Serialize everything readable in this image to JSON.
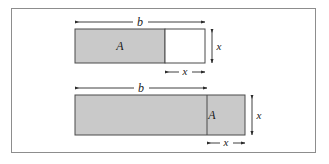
{
  "figure": {
    "background_color": "#ffffff",
    "frame": {
      "name": "outer-frame",
      "x": 11,
      "y": 8,
      "width": 305,
      "height": 145,
      "stroke_color": "#8d8d8d",
      "fill_color": "#ffffff"
    },
    "colors": {
      "shaded_fill": "#c9c9c9",
      "unshaded_fill": "#ffffff",
      "edge": "#4a4a4a",
      "dimension_line": "#2b2b2b",
      "text": "#1a1a1a"
    },
    "panels": [
      {
        "id": "top-panel",
        "name": "top-diagram",
        "rectangle": {
          "x": 75,
          "y": 29,
          "width": 130,
          "height": 34
        },
        "shaded_region": {
          "label": "A",
          "x": 75,
          "y": 29,
          "width": 90,
          "height": 34,
          "fill": "#c9c9c9",
          "label_x": 120,
          "label_y": 50
        },
        "unshaded_region": {
          "x": 165,
          "y": 29,
          "width": 40,
          "height": 34,
          "fill": "#ffffff"
        },
        "dimensions": [
          {
            "id": "top-width-b",
            "label": "b",
            "orientation": "horizontal",
            "x1": 75,
            "x2": 205,
            "y": 22,
            "label_x": 140,
            "label_y": 25
          },
          {
            "id": "top-height-x",
            "label": "x",
            "orientation": "vertical",
            "x": 212,
            "y1": 29,
            "y2": 63,
            "label_x": 219,
            "label_y": 50
          },
          {
            "id": "top-subwidth-x",
            "label": "x",
            "orientation": "horizontal",
            "x1": 165,
            "x2": 205,
            "y": 72,
            "label_x": 185,
            "label_y": 75
          }
        ]
      },
      {
        "id": "bottom-panel",
        "name": "bottom-diagram",
        "rectangle": {
          "x": 75,
          "y": 95,
          "width": 170,
          "height": 40
        },
        "shaded_region": {
          "label": "A",
          "x": 75,
          "y": 95,
          "width": 132,
          "height": 40,
          "fill": "#c9c9c9",
          "label_x": 212,
          "label_y": 119
        },
        "divider": {
          "id": "bottom-divider",
          "x": 207,
          "y1": 95,
          "y2": 135
        },
        "dimensions": [
          {
            "id": "bottom-width-b",
            "label": "b",
            "orientation": "horizontal",
            "x1": 75,
            "x2": 207,
            "y": 88,
            "label_x": 141,
            "label_y": 91
          },
          {
            "id": "bottom-height-x",
            "label": "x",
            "orientation": "vertical",
            "x": 252,
            "y1": 95,
            "y2": 135,
            "label_x": 259,
            "label_y": 119
          },
          {
            "id": "bottom-subwidth-x",
            "label": "x",
            "orientation": "horizontal",
            "x1": 207,
            "x2": 245,
            "y": 143,
            "label_x": 226,
            "label_y": 146
          }
        ]
      }
    ],
    "labels": {
      "b": "b",
      "x": "x",
      "A": "A"
    }
  }
}
